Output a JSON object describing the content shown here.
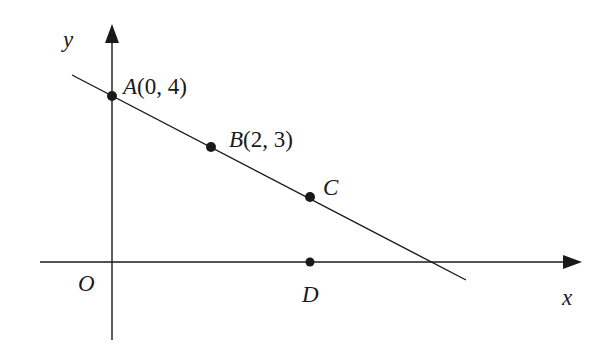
{
  "diagram": {
    "type": "coordinate-plane",
    "axes": {
      "x_label": "x",
      "y_label": "y",
      "origin_label": "O"
    },
    "points": [
      {
        "id": "A",
        "name": "A",
        "coords": "(0, 4)",
        "x": 0,
        "y": 4
      },
      {
        "id": "B",
        "name": "B",
        "coords": "(2, 3)",
        "x": 2,
        "y": 3
      },
      {
        "id": "C",
        "name": "C",
        "coords": "",
        "x": 4,
        "y": 2
      },
      {
        "id": "D",
        "name": "D",
        "coords": "",
        "x": 4,
        "y": 0
      }
    ],
    "line": {
      "passes_through": [
        "A",
        "B",
        "C"
      ],
      "equation": "y = -x/2 + 4"
    },
    "colors": {
      "stroke": "#1a1a1a",
      "background": "#ffffff"
    }
  }
}
